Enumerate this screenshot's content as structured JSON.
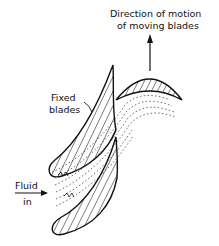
{
  "diagram": {
    "labels": {
      "direction_line1": "Direction of motion",
      "direction_line2": "of moving blades",
      "fixed_line1": "Fixed",
      "fixed_line2": "blades",
      "fluid_line1": "Fluid",
      "fluid_line2": "in"
    },
    "colors": {
      "ink": "#111111",
      "background": "#ffffff"
    }
  }
}
